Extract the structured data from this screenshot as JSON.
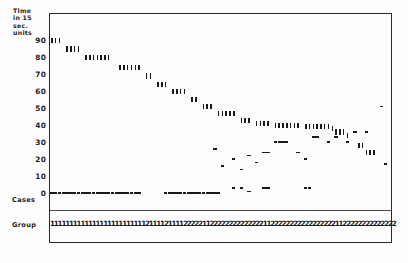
{
  "figure": {
    "yaxis_title_lines": [
      "Time",
      "in 15",
      "sec.",
      "units"
    ],
    "ytick_labels": [
      "90",
      "80",
      "70",
      "60",
      "50",
      "40",
      "30",
      "20",
      "10",
      "0"
    ],
    "row_labels": {
      "cases": "Cases",
      "group": "Group"
    }
  },
  "chart_data": {
    "type": "scatter",
    "title": "",
    "xlabel": "Cases",
    "ylabel": "Time in 15 sec. units",
    "ylim": [
      0,
      95
    ],
    "yticks": [
      0,
      10,
      20,
      30,
      40,
      50,
      60,
      70,
      80,
      90
    ],
    "grid": false,
    "legend": "none",
    "x_is_case_index": true,
    "n_cases": 90,
    "marker_types": {
      "tick": "vertical bar marker (group 1 dominant / survival time)",
      "dash": "horizontal dash marker (group 2 dominant / censored time)"
    },
    "series": [
      {
        "name": "time",
        "marker": "tick",
        "points": [
          {
            "case": 1,
            "y": 90
          },
          {
            "case": 2,
            "y": 90
          },
          {
            "case": 3,
            "y": 90
          },
          {
            "case": 5,
            "y": 85
          },
          {
            "case": 6,
            "y": 85
          },
          {
            "case": 7,
            "y": 85
          },
          {
            "case": 8,
            "y": 85
          },
          {
            "case": 10,
            "y": 80
          },
          {
            "case": 11,
            "y": 80
          },
          {
            "case": 12,
            "y": 80
          },
          {
            "case": 13,
            "y": 80
          },
          {
            "case": 14,
            "y": 80
          },
          {
            "case": 15,
            "y": 80
          },
          {
            "case": 16,
            "y": 80
          },
          {
            "case": 19,
            "y": 74
          },
          {
            "case": 20,
            "y": 74
          },
          {
            "case": 21,
            "y": 74
          },
          {
            "case": 22,
            "y": 74
          },
          {
            "case": 23,
            "y": 74
          },
          {
            "case": 24,
            "y": 74
          },
          {
            "case": 26,
            "y": 69
          },
          {
            "case": 27,
            "y": 69
          },
          {
            "case": 29,
            "y": 64
          },
          {
            "case": 30,
            "y": 64
          },
          {
            "case": 31,
            "y": 64
          },
          {
            "case": 33,
            "y": 60
          },
          {
            "case": 34,
            "y": 60
          },
          {
            "case": 35,
            "y": 60
          },
          {
            "case": 36,
            "y": 60
          },
          {
            "case": 38,
            "y": 55
          },
          {
            "case": 39,
            "y": 55
          },
          {
            "case": 41,
            "y": 51
          },
          {
            "case": 42,
            "y": 51
          },
          {
            "case": 43,
            "y": 51
          },
          {
            "case": 45,
            "y": 47
          },
          {
            "case": 46,
            "y": 47
          },
          {
            "case": 47,
            "y": 47
          },
          {
            "case": 48,
            "y": 47
          },
          {
            "case": 49,
            "y": 47
          },
          {
            "case": 51,
            "y": 43
          },
          {
            "case": 52,
            "y": 43
          },
          {
            "case": 53,
            "y": 43
          },
          {
            "case": 55,
            "y": 41
          },
          {
            "case": 56,
            "y": 41
          },
          {
            "case": 57,
            "y": 41
          },
          {
            "case": 58,
            "y": 41
          },
          {
            "case": 60,
            "y": 40
          },
          {
            "case": 61,
            "y": 40
          },
          {
            "case": 62,
            "y": 40
          },
          {
            "case": 63,
            "y": 40
          },
          {
            "case": 64,
            "y": 40
          },
          {
            "case": 65,
            "y": 40
          },
          {
            "case": 66,
            "y": 40
          },
          {
            "case": 68,
            "y": 39
          },
          {
            "case": 69,
            "y": 39
          },
          {
            "case": 70,
            "y": 39
          },
          {
            "case": 71,
            "y": 39
          },
          {
            "case": 72,
            "y": 39
          },
          {
            "case": 73,
            "y": 39
          },
          {
            "case": 74,
            "y": 39
          },
          {
            "case": 75,
            "y": 38
          },
          {
            "case": 76,
            "y": 36
          },
          {
            "case": 77,
            "y": 36
          },
          {
            "case": 78,
            "y": 36
          },
          {
            "case": 79,
            "y": 34
          },
          {
            "case": 82,
            "y": 28
          },
          {
            "case": 83,
            "y": 28
          },
          {
            "case": 84,
            "y": 24
          },
          {
            "case": 85,
            "y": 24
          },
          {
            "case": 86,
            "y": 24
          }
        ]
      },
      {
        "name": "time-censored",
        "marker": "dash",
        "points": [
          {
            "case": 44,
            "y": 26
          },
          {
            "case": 46,
            "y": 16
          },
          {
            "case": 49,
            "y": 20
          },
          {
            "case": 51,
            "y": 14
          },
          {
            "case": 53,
            "y": 22
          },
          {
            "case": 55,
            "y": 18
          },
          {
            "case": 57,
            "y": 24
          },
          {
            "case": 58,
            "y": 24
          },
          {
            "case": 60,
            "y": 30
          },
          {
            "case": 61,
            "y": 30
          },
          {
            "case": 62,
            "y": 30
          },
          {
            "case": 63,
            "y": 30
          },
          {
            "case": 66,
            "y": 24
          },
          {
            "case": 68,
            "y": 20
          },
          {
            "case": 70,
            "y": 33
          },
          {
            "case": 71,
            "y": 33
          },
          {
            "case": 74,
            "y": 30
          },
          {
            "case": 76,
            "y": 33
          },
          {
            "case": 79,
            "y": 30
          },
          {
            "case": 81,
            "y": 36
          },
          {
            "case": 84,
            "y": 36
          },
          {
            "case": 88,
            "y": 51
          },
          {
            "case": 89,
            "y": 17
          }
        ]
      },
      {
        "name": "baseline-zero",
        "marker": "dash",
        "points": [
          {
            "case": 1,
            "y": 0
          },
          {
            "case": 2,
            "y": 0
          },
          {
            "case": 3,
            "y": 0
          },
          {
            "case": 4,
            "y": 0
          },
          {
            "case": 5,
            "y": 0
          },
          {
            "case": 6,
            "y": 0
          },
          {
            "case": 7,
            "y": 0
          },
          {
            "case": 8,
            "y": 0
          },
          {
            "case": 9,
            "y": 0
          },
          {
            "case": 10,
            "y": 0
          },
          {
            "case": 11,
            "y": 0
          },
          {
            "case": 12,
            "y": 0
          },
          {
            "case": 13,
            "y": 0
          },
          {
            "case": 14,
            "y": 0
          },
          {
            "case": 15,
            "y": 0
          },
          {
            "case": 16,
            "y": 0
          },
          {
            "case": 17,
            "y": 0
          },
          {
            "case": 18,
            "y": 0
          },
          {
            "case": 19,
            "y": 0
          },
          {
            "case": 20,
            "y": 0
          },
          {
            "case": 21,
            "y": 0
          },
          {
            "case": 22,
            "y": 0
          },
          {
            "case": 23,
            "y": 0
          },
          {
            "case": 24,
            "y": 0
          },
          {
            "case": 31,
            "y": 0
          },
          {
            "case": 32,
            "y": 0
          },
          {
            "case": 33,
            "y": 0
          },
          {
            "case": 34,
            "y": 0
          },
          {
            "case": 35,
            "y": 0
          },
          {
            "case": 36,
            "y": 0
          },
          {
            "case": 37,
            "y": 0
          },
          {
            "case": 38,
            "y": 0
          },
          {
            "case": 39,
            "y": 0
          },
          {
            "case": 40,
            "y": 0
          },
          {
            "case": 41,
            "y": 0
          },
          {
            "case": 42,
            "y": 0
          },
          {
            "case": 43,
            "y": 0
          },
          {
            "case": 44,
            "y": 0
          },
          {
            "case": 45,
            "y": 0
          },
          {
            "case": 49,
            "y": 3
          },
          {
            "case": 51,
            "y": 3
          },
          {
            "case": 53,
            "y": 1
          },
          {
            "case": 57,
            "y": 3
          },
          {
            "case": 58,
            "y": 3
          },
          {
            "case": 68,
            "y": 3
          },
          {
            "case": 69,
            "y": 3
          }
        ]
      }
    ],
    "group_row": {
      "label": "Group",
      "values": [
        "1",
        "1",
        "1",
        "1",
        "1",
        "1",
        "1",
        "1",
        "1",
        "1",
        "1",
        "1",
        "1",
        "1",
        "1",
        "1",
        "1",
        "1",
        "1",
        "1",
        "1",
        "1",
        "1",
        "1",
        "1",
        "2",
        "1",
        "1",
        "1",
        "1",
        "2",
        "1",
        "1",
        "1",
        "1",
        "2",
        "2",
        "2",
        "2",
        "2",
        "1",
        "1",
        "2",
        "2",
        "2",
        "2",
        "2",
        "2",
        "2",
        "2",
        "2",
        "2",
        "2",
        "2",
        "2",
        "2",
        "1",
        "1",
        "2",
        "2",
        "2",
        "2",
        "2",
        "2",
        "2",
        "2",
        "2",
        "2",
        "2",
        "2",
        "2",
        "2",
        "2",
        "2",
        "2",
        "1",
        "1",
        "2",
        "2",
        "2",
        "2",
        "2",
        "2",
        "2",
        "2",
        "2",
        "2",
        "2",
        "2",
        "2",
        "2"
      ]
    }
  }
}
